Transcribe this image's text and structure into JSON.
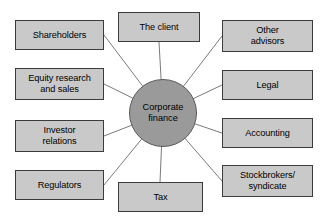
{
  "diagram": {
    "hub": {
      "label": "Corporate\nfinance",
      "cx": 163,
      "cy": 113,
      "r": 34,
      "fill": "#9a9a9a",
      "stroke": "#5a5a5a"
    },
    "style": {
      "box_fill": "#c9c9c9",
      "box_stroke": "#3c3c3c",
      "edge_stroke": "#7a7a7a",
      "background": "#ffffff",
      "text_color": "#000000"
    },
    "nodes": [
      {
        "id": "shareholders",
        "label": "Shareholders",
        "x": 15,
        "y": 20,
        "w": 89,
        "h": 30,
        "anchor_x": 104,
        "anchor_y": 35
      },
      {
        "id": "equity-research",
        "label": "Equity research\nand sales",
        "x": 15,
        "y": 68,
        "w": 89,
        "h": 32,
        "anchor_x": 104,
        "anchor_y": 84
      },
      {
        "id": "investor-relations",
        "label": "Investor\nrelations",
        "x": 15,
        "y": 120,
        "w": 89,
        "h": 32,
        "anchor_x": 104,
        "anchor_y": 136
      },
      {
        "id": "regulators",
        "label": "Regulators",
        "x": 15,
        "y": 170,
        "w": 89,
        "h": 30,
        "anchor_x": 104,
        "anchor_y": 185
      },
      {
        "id": "the-client",
        "label": "The client",
        "x": 118,
        "y": 12,
        "w": 82,
        "h": 30,
        "anchor_x": 159,
        "anchor_y": 42
      },
      {
        "id": "tax",
        "label": "Tax",
        "x": 118,
        "y": 182,
        "w": 85,
        "h": 30,
        "anchor_x": 160,
        "anchor_y": 182
      },
      {
        "id": "other-advisors",
        "label": "Other\nadvisors",
        "x": 222,
        "y": 20,
        "w": 91,
        "h": 32,
        "anchor_x": 222,
        "anchor_y": 36
      },
      {
        "id": "legal",
        "label": "Legal",
        "x": 222,
        "y": 70,
        "w": 91,
        "h": 30,
        "anchor_x": 222,
        "anchor_y": 85
      },
      {
        "id": "accounting",
        "label": "Accounting",
        "x": 222,
        "y": 118,
        "w": 91,
        "h": 30,
        "anchor_x": 222,
        "anchor_y": 133
      },
      {
        "id": "stockbrokers",
        "label": "Stockbrokers/\nsyndicate",
        "x": 222,
        "y": 165,
        "w": 91,
        "h": 32,
        "anchor_x": 222,
        "anchor_y": 181
      }
    ]
  }
}
